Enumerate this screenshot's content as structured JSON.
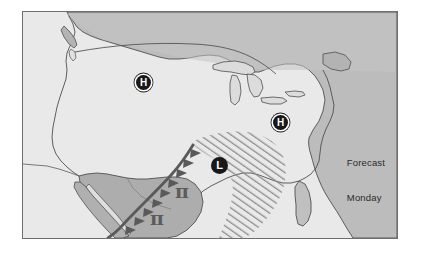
{
  "figure": {
    "kind": "weather-forecast-map",
    "region": "North America — contiguous United States, southern Canada, northern Mexico",
    "background_color": "#ffffff",
    "frame_border_color": "#6f6f6f"
  },
  "map": {
    "ocean_color": "#e9e9e9",
    "land_color": "#b9b9b9",
    "land_color_secondary": "#c6c6c6",
    "coastline_color": "#4a4a4a",
    "border_line_color": "#555555"
  },
  "caption": {
    "line_1": "Forecast",
    "line_2": "Monday"
  },
  "pressure_centers": [
    {
      "id": "high-1",
      "symbol": "H",
      "type": "high",
      "label": "High pressure center",
      "x": 113,
      "y": 63
    },
    {
      "id": "high-2",
      "symbol": "H",
      "type": "high",
      "label": "High pressure center",
      "x": 250,
      "y": 103
    },
    {
      "id": "low-1",
      "symbol": "L",
      "type": "low",
      "label": "Low pressure center",
      "x": 188,
      "y": 145
    }
  ],
  "fronts": [
    {
      "id": "cold-front-1",
      "type": "cold-front",
      "label": "Cold front with triangular barbs",
      "color": "#5a5a5a",
      "stroke_width": 2.6,
      "barb_count": 9
    }
  ],
  "precipitation_area": {
    "id": "precip-hatch-1",
    "label": "Hatched precipitation region",
    "pattern": "diagonal-hatch",
    "hatch_color": "#8c8c8c",
    "hatch_angle_deg": 55,
    "hatch_spacing_px": 5
  },
  "glyphs": [
    {
      "id": "glyph-1",
      "symbol": "π",
      "label": "pi-like weather glyph",
      "color": "#5c5c5c",
      "x": 152,
      "y": 170
    },
    {
      "id": "glyph-2",
      "symbol": "π",
      "label": "pi-like weather glyph",
      "color": "#5c5c5c",
      "x": 127,
      "y": 197
    }
  ]
}
